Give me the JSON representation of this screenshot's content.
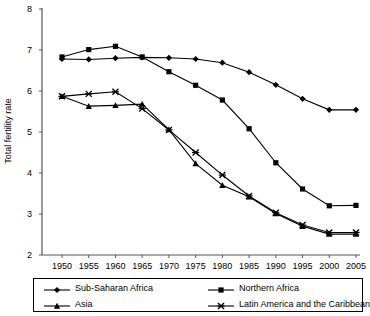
{
  "chart_data": {
    "type": "line",
    "title": "",
    "xlabel": "",
    "ylabel": "Total fertility rate",
    "x": [
      1950,
      1955,
      1960,
      1965,
      1970,
      1975,
      1980,
      1985,
      1990,
      1995,
      2000,
      2005
    ],
    "xtick_labels": [
      "1950",
      "1955",
      "1960",
      "1965",
      "1970",
      "1975",
      "1980",
      "1985",
      "1990",
      "1995",
      "2000",
      "2005"
    ],
    "ytick_labels": [
      "8",
      "7",
      "6",
      "5",
      "4",
      "3",
      "2"
    ],
    "yticks": [
      8,
      7,
      6,
      5,
      4,
      3,
      2
    ],
    "ylim": [
      2,
      8
    ],
    "xlim": [
      1950,
      2005
    ],
    "grid": false,
    "legend_position": "bottom",
    "series": [
      {
        "name": "Sub-Saharan Africa",
        "marker": "diamond",
        "color": "#000000",
        "values": [
          6.78,
          6.77,
          6.8,
          6.82,
          6.81,
          6.78,
          6.69,
          6.46,
          6.15,
          5.81,
          5.54,
          5.54
        ]
      },
      {
        "name": "Northern Africa",
        "marker": "square",
        "color": "#000000",
        "values": [
          6.83,
          7.01,
          7.09,
          6.83,
          6.47,
          6.14,
          5.78,
          5.08,
          4.25,
          3.61,
          3.2,
          3.21
        ]
      },
      {
        "name": "Asia",
        "marker": "triangle",
        "color": "#000000",
        "values": [
          5.87,
          5.63,
          5.65,
          5.68,
          5.06,
          4.23,
          3.7,
          3.42,
          3.01,
          2.7,
          2.51,
          2.51
        ]
      },
      {
        "name": "Latin America and the Caribbean",
        "marker": "x",
        "color": "#000000",
        "values": [
          5.87,
          5.93,
          5.98,
          5.57,
          5.05,
          4.5,
          3.95,
          3.44,
          3.03,
          2.73,
          2.55,
          2.55
        ]
      }
    ]
  },
  "legend": {
    "entries": [
      {
        "label": "Sub-Saharan Africa",
        "marker": "diamond"
      },
      {
        "label": "Northern Africa",
        "marker": "square"
      },
      {
        "label": "Asia",
        "marker": "triangle"
      },
      {
        "label": "Latin America and the Caribbean",
        "marker": "x"
      }
    ]
  },
  "axis": {
    "y_title": "Total fertility rate"
  }
}
